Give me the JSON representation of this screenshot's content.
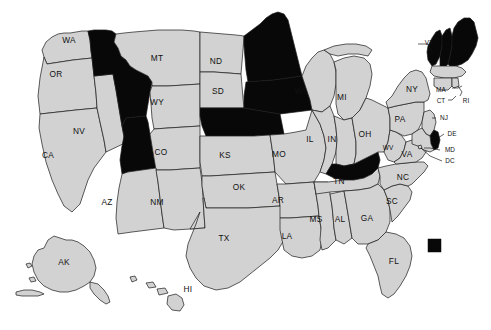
{
  "map": {
    "title": "United States state choropleth map",
    "projection_note": "Alaska and Hawaii shown as insets at lower left",
    "colors": {
      "highlighted_fill": "#080808",
      "default_fill": "#d2d2d2",
      "border_stroke": "#1a1a1a",
      "background": "#ffffff",
      "label_color": "#111111"
    },
    "legend": {
      "swatch_color": "#080808",
      "swatch_label": ""
    },
    "highlighted_states": [
      "ID",
      "UT",
      "MN",
      "IA",
      "NE",
      "KY",
      "ME",
      "NH",
      "VT",
      "DE"
    ],
    "states": [
      {
        "code": "WA",
        "label": "WA",
        "highlighted": false,
        "label_x": 69,
        "label_y": 41
      },
      {
        "code": "OR",
        "label": "OR",
        "highlighted": false,
        "label_x": 56,
        "label_y": 75
      },
      {
        "code": "CA",
        "label": "CA",
        "highlighted": false,
        "label_x": 48,
        "label_y": 156
      },
      {
        "code": "NV",
        "label": "NV",
        "highlighted": false,
        "label_x": 79,
        "label_y": 132
      },
      {
        "code": "ID",
        "label": "",
        "highlighted": true,
        "label_x": 106,
        "label_y": 80
      },
      {
        "code": "UT",
        "label": "",
        "highlighted": true,
        "label_x": 110,
        "label_y": 150
      },
      {
        "code": "MT",
        "label": "MT",
        "highlighted": false,
        "label_x": 157,
        "label_y": 59
      },
      {
        "code": "WY",
        "label": "WY",
        "highlighted": false,
        "label_x": 157,
        "label_y": 103
      },
      {
        "code": "CO",
        "label": "CO",
        "highlighted": false,
        "label_x": 161,
        "label_y": 153
      },
      {
        "code": "AZ",
        "label": "AZ",
        "highlighted": false,
        "label_x": 107,
        "label_y": 203
      },
      {
        "code": "NM",
        "label": "NM",
        "highlighted": false,
        "label_x": 157,
        "label_y": 203
      },
      {
        "code": "ND",
        "label": "ND",
        "highlighted": false,
        "label_x": 216,
        "label_y": 62
      },
      {
        "code": "SD",
        "label": "SD",
        "highlighted": false,
        "label_x": 218,
        "label_y": 92
      },
      {
        "code": "NE",
        "label": "",
        "highlighted": true,
        "label_x": 220,
        "label_y": 122
      },
      {
        "code": "KS",
        "label": "KS",
        "highlighted": false,
        "label_x": 225,
        "label_y": 156
      },
      {
        "code": "OK",
        "label": "OK",
        "highlighted": false,
        "label_x": 239,
        "label_y": 188
      },
      {
        "code": "TX",
        "label": "TX",
        "highlighted": false,
        "label_x": 224,
        "label_y": 239
      },
      {
        "code": "MN",
        "label": "",
        "highlighted": true,
        "label_x": 257,
        "label_y": 60
      },
      {
        "code": "IA",
        "label": "",
        "highlighted": true,
        "label_x": 266,
        "label_y": 113
      },
      {
        "code": "MO",
        "label": "MO",
        "highlighted": false,
        "label_x": 279,
        "label_y": 155
      },
      {
        "code": "AR",
        "label": "AR",
        "highlighted": false,
        "label_x": 278,
        "label_y": 201
      },
      {
        "code": "LA",
        "label": "LA",
        "highlighted": false,
        "label_x": 287,
        "label_y": 237
      },
      {
        "code": "WI",
        "label": "WI",
        "highlighted": false,
        "label_x": 300,
        "label_y": 92
      },
      {
        "code": "IL",
        "label": "IL",
        "highlighted": false,
        "label_x": 310,
        "label_y": 140
      },
      {
        "code": "MS",
        "label": "MS",
        "highlighted": false,
        "label_x": 316,
        "label_y": 220
      },
      {
        "code": "MI",
        "label": "MI",
        "highlighted": false,
        "label_x": 342,
        "label_y": 98
      },
      {
        "code": "IN",
        "label": "IN",
        "highlighted": false,
        "label_x": 332,
        "label_y": 140
      },
      {
        "code": "KY",
        "label": "",
        "highlighted": true,
        "label_x": 347,
        "label_y": 163
      },
      {
        "code": "TN",
        "label": "TN",
        "highlighted": false,
        "label_x": 339,
        "label_y": 182
      },
      {
        "code": "AL",
        "label": "AL",
        "highlighted": false,
        "label_x": 340,
        "label_y": 220
      },
      {
        "code": "OH",
        "label": "OH",
        "highlighted": false,
        "label_x": 365,
        "label_y": 135
      },
      {
        "code": "GA",
        "label": "GA",
        "highlighted": false,
        "label_x": 367,
        "label_y": 219
      },
      {
        "code": "FL",
        "label": "FL",
        "highlighted": false,
        "label_x": 394,
        "label_y": 262
      },
      {
        "code": "SC",
        "label": "SC",
        "highlighted": false,
        "label_x": 392,
        "label_y": 202
      },
      {
        "code": "NC",
        "label": "NC",
        "highlighted": false,
        "label_x": 403,
        "label_y": 178
      },
      {
        "code": "WV",
        "label": "WV",
        "highlighted": false,
        "label_x": 388,
        "label_y": 148
      },
      {
        "code": "VA",
        "label": "VA",
        "highlighted": false,
        "label_x": 407,
        "label_y": 155
      },
      {
        "code": "PA",
        "label": "PA",
        "highlighted": false,
        "label_x": 400,
        "label_y": 120
      },
      {
        "code": "NY",
        "label": "NY",
        "highlighted": false,
        "label_x": 412,
        "label_y": 90
      },
      {
        "code": "VT",
        "label": "VT",
        "highlighted": true,
        "label_x": 430,
        "label_y": 43
      },
      {
        "code": "NH",
        "label": "",
        "highlighted": true,
        "label_x": 443,
        "label_y": 52
      },
      {
        "code": "ME",
        "label": "",
        "highlighted": true,
        "label_x": 459,
        "label_y": 42
      },
      {
        "code": "MA",
        "label": "MA",
        "highlighted": false,
        "label_x": 442,
        "label_y": 90
      },
      {
        "code": "CT",
        "label": "CT",
        "highlighted": false,
        "label_x": 440,
        "label_y": 100
      },
      {
        "code": "RI",
        "label": "RI",
        "highlighted": false,
        "label_x": 463,
        "label_y": 100
      },
      {
        "code": "NJ",
        "label": "NJ",
        "highlighted": false,
        "label_x": 444,
        "label_y": 118
      },
      {
        "code": "DE",
        "label": "DE",
        "highlighted": true,
        "label_x": 452,
        "label_y": 134
      },
      {
        "code": "MD",
        "label": "MD",
        "highlighted": false,
        "label_x": 448,
        "label_y": 150
      },
      {
        "code": "DC",
        "label": "DC",
        "highlighted": false,
        "label_x": 451,
        "label_y": 161
      },
      {
        "code": "AK",
        "label": "AK",
        "highlighted": false,
        "label_x": 64,
        "label_y": 263
      },
      {
        "code": "HI",
        "label": "HI",
        "highlighted": false,
        "label_x": 188,
        "label_y": 290
      }
    ],
    "callout_labels": [
      {
        "code": "VT",
        "text": "VT"
      },
      {
        "code": "MA",
        "text": "MA"
      },
      {
        "code": "CT",
        "text": "CT"
      },
      {
        "code": "RI",
        "text": "RI"
      },
      {
        "code": "NJ",
        "text": "NJ"
      },
      {
        "code": "DE",
        "text": "DE"
      },
      {
        "code": "MD",
        "text": "MD"
      },
      {
        "code": "DC",
        "text": "DC"
      }
    ]
  }
}
